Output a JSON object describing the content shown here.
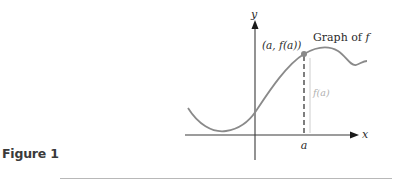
{
  "figure": {
    "caption": "Figure 1",
    "axes": {
      "x_label": "x",
      "y_label": "y"
    },
    "curve_label_prefix": "Graph of ",
    "curve_label_func": "f",
    "point_label": "(a, f(a))",
    "tick_label": "a",
    "height_label": "f(a)",
    "colors": {
      "axis": "#3a3a3a",
      "curve": "#8a8a8a",
      "point": "#8a8a8a",
      "dashed_line": "#3a3a3a",
      "height_line": "#c8c8c8",
      "height_label": "#b0b0b0",
      "divider": "#b8b8b8"
    }
  }
}
